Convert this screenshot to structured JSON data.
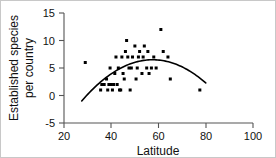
{
  "chart_data": {
    "type": "scatter",
    "title": "",
    "xlabel": "Latitude",
    "ylabel": "Established species per country",
    "ylabel_line1": "Established species",
    "ylabel_line2": "per country",
    "xlim": [
      20,
      100
    ],
    "ylim": [
      -5,
      15
    ],
    "xticks": [
      20,
      40,
      60,
      80,
      100
    ],
    "xtick_labels": [
      "20",
      "40",
      "60",
      "80",
      "100"
    ],
    "yticks": [
      -5,
      0,
      5,
      10,
      15
    ],
    "ytick_labels": [
      "-5",
      "0",
      "5",
      "10",
      "15"
    ],
    "grid": false,
    "legend": null,
    "marker_color": "#000000",
    "marker_shape": "square",
    "curve_color": "#000000",
    "axis_color": "#555555",
    "points": [
      {
        "x": 29.0,
        "y": 6.0
      },
      {
        "x": 35.5,
        "y": 1.0
      },
      {
        "x": 36.0,
        "y": 2.0
      },
      {
        "x": 37.0,
        "y": 2.0
      },
      {
        "x": 38.0,
        "y": 3.0
      },
      {
        "x": 38.5,
        "y": 1.0
      },
      {
        "x": 39.0,
        "y": 2.0
      },
      {
        "x": 39.5,
        "y": 5.0
      },
      {
        "x": 40.0,
        "y": 2.0
      },
      {
        "x": 40.5,
        "y": 1.0
      },
      {
        "x": 41.0,
        "y": 2.0
      },
      {
        "x": 41.5,
        "y": 4.0
      },
      {
        "x": 42.0,
        "y": 7.0
      },
      {
        "x": 42.5,
        "y": 2.0
      },
      {
        "x": 43.0,
        "y": 5.0
      },
      {
        "x": 43.5,
        "y": 1.0
      },
      {
        "x": 44.0,
        "y": 1.0
      },
      {
        "x": 44.5,
        "y": 7.0
      },
      {
        "x": 45.0,
        "y": 4.0
      },
      {
        "x": 45.5,
        "y": 3.0
      },
      {
        "x": 46.0,
        "y": 8.0
      },
      {
        "x": 46.5,
        "y": 10.0
      },
      {
        "x": 47.0,
        "y": 7.0
      },
      {
        "x": 47.5,
        "y": 5.0
      },
      {
        "x": 48.0,
        "y": 1.0
      },
      {
        "x": 48.5,
        "y": 5.0
      },
      {
        "x": 49.0,
        "y": 7.0
      },
      {
        "x": 50.0,
        "y": 9.0
      },
      {
        "x": 50.5,
        "y": 3.0
      },
      {
        "x": 51.0,
        "y": 5.0
      },
      {
        "x": 51.5,
        "y": 7.0
      },
      {
        "x": 52.0,
        "y": 8.0
      },
      {
        "x": 53.0,
        "y": 4.0
      },
      {
        "x": 53.5,
        "y": 7.0
      },
      {
        "x": 54.0,
        "y": 9.0
      },
      {
        "x": 55.0,
        "y": 5.0
      },
      {
        "x": 55.5,
        "y": 8.0
      },
      {
        "x": 56.0,
        "y": 4.0
      },
      {
        "x": 57.0,
        "y": 5.0
      },
      {
        "x": 58.0,
        "y": 7.0
      },
      {
        "x": 59.0,
        "y": 5.0
      },
      {
        "x": 61.0,
        "y": 12.0
      },
      {
        "x": 62.0,
        "y": 8.0
      },
      {
        "x": 64.0,
        "y": 7.0
      },
      {
        "x": 65.0,
        "y": 3.0
      },
      {
        "x": 77.5,
        "y": 1.0
      }
    ],
    "fit_curve": {
      "kind": "quadratic",
      "x_start": 27.5,
      "x_end": 80.0,
      "vertex_x": 57.5,
      "vertex_y": 6.5,
      "y_start": -1.0,
      "y_end": 3.3
    }
  }
}
